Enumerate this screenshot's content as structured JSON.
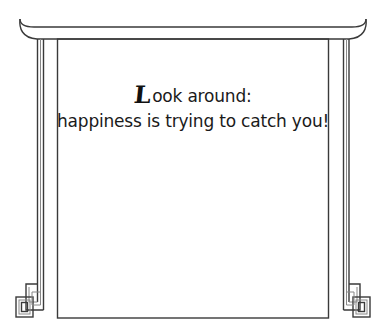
{
  "card": {
    "style": "hanging-scroll-frame",
    "stroke_color": "#333333",
    "background": "#ffffff"
  },
  "quote": {
    "drop_cap": "L",
    "line1_rest": "ook around:",
    "line2": "happiness is trying to catch you!"
  }
}
